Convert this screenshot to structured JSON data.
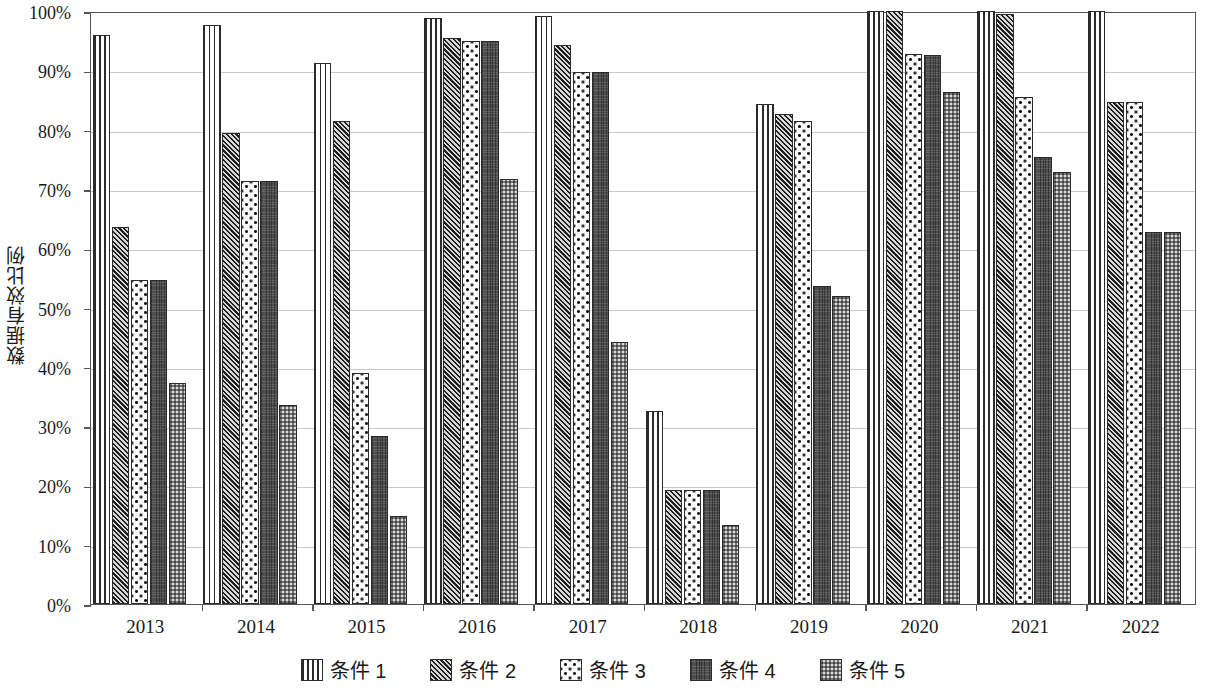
{
  "chart_data": {
    "type": "bar",
    "title": "",
    "xlabel": "",
    "ylabel": "数据有效比例",
    "ylim": [
      0,
      1
    ],
    "ytick_labels": [
      "0%",
      "10%",
      "20%",
      "30%",
      "40%",
      "50%",
      "60%",
      "70%",
      "80%",
      "90%",
      "100%"
    ],
    "ytick_values": [
      0,
      10,
      20,
      30,
      40,
      50,
      60,
      70,
      80,
      90,
      100
    ],
    "grid": true,
    "legend_position": "bottom",
    "categories": [
      "2013",
      "2014",
      "2015",
      "2016",
      "2017",
      "2018",
      "2019",
      "2020",
      "2021",
      "2022"
    ],
    "series": [
      {
        "name": "条件 1",
        "pattern": "vertical-stripes",
        "values": [
          96.0,
          97.7,
          91.3,
          98.8,
          99.2,
          32.5,
          84.4,
          100.0,
          100.0,
          100.0
        ]
      },
      {
        "name": "条件 2",
        "pattern": "diagonal-hatch",
        "values": [
          63.5,
          79.5,
          81.5,
          95.5,
          94.3,
          19.2,
          82.6,
          100.0,
          99.5,
          84.7
        ]
      },
      {
        "name": "条件 3",
        "pattern": "polka-dots",
        "values": [
          54.7,
          71.3,
          39.0,
          95.0,
          89.7,
          19.2,
          81.5,
          92.8,
          85.5,
          84.7
        ]
      },
      {
        "name": "条件 4",
        "pattern": "solid-dark-gray",
        "values": [
          54.7,
          71.3,
          28.3,
          95.0,
          89.7,
          19.2,
          53.6,
          92.5,
          75.3,
          62.7
        ]
      },
      {
        "name": "条件 5",
        "pattern": "light-checker",
        "values": [
          37.3,
          33.5,
          14.8,
          71.6,
          44.2,
          13.3,
          52.0,
          86.3,
          72.9,
          62.7
        ]
      }
    ]
  },
  "axis": {
    "y_title": "数据有效比例"
  },
  "colors": {
    "frame": "#555555",
    "gridline": "#c8c8c8",
    "bar_outline": "#2b2b2b",
    "background": "#ffffff"
  }
}
